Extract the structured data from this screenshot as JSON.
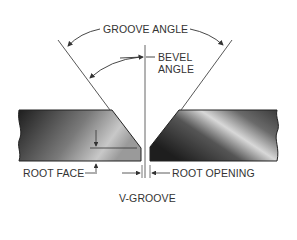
{
  "diagram": {
    "title": "V-GROOVE",
    "labels": {
      "groove_angle": "GROOVE ANGLE",
      "bevel_angle_line1": "BEVEL",
      "bevel_angle_line2": "ANGLE",
      "root_face": "ROOT FACE",
      "root_opening": "ROOT OPENING"
    },
    "colors": {
      "line": "#444444",
      "plate_dark": "#2a2a2a",
      "plate_light": "#d8d8d8",
      "text": "#333333"
    }
  }
}
